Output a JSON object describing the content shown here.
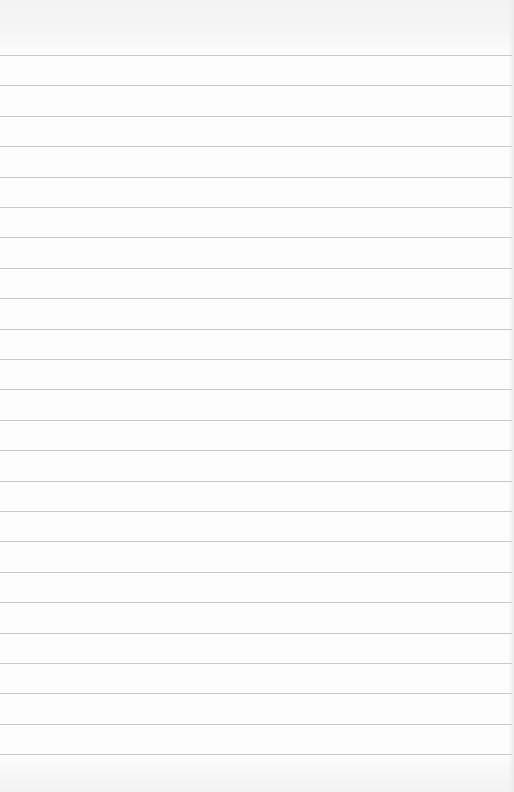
{
  "page": {
    "type": "lined-paper",
    "background_color": "#fdfdfd",
    "line_color": "#c9c9c9",
    "line_count": 24,
    "first_line_y": 55,
    "line_spacing": 30.4,
    "text_content": []
  }
}
